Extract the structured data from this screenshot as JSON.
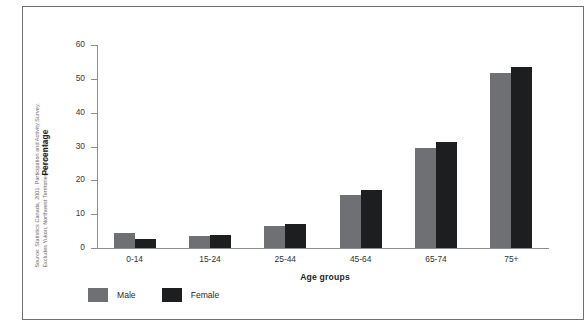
{
  "source_note": {
    "line1": "Source: Statistics Canada, 2001. Participation and Activity Survey.",
    "line2": "Excludes Yukon, Northwest Territories and Nunavut."
  },
  "legend": {
    "male_label": "Male",
    "female_label": "Female",
    "male_color": "#6e7073",
    "female_color": "#1d1e20"
  },
  "chart_data": {
    "type": "bar",
    "title": "",
    "xlabel": "Age groups",
    "ylabel": "Percentage",
    "categories": [
      "0-14",
      "15-24",
      "25-44",
      "45-64",
      "65-74",
      "75+"
    ],
    "series": [
      {
        "name": "Male",
        "values": [
          4.3,
          3.6,
          6.4,
          15.6,
          29.6,
          51.6
        ],
        "color": "#6e7073"
      },
      {
        "name": "Female",
        "values": [
          2.6,
          3.9,
          7.0,
          17.0,
          31.3,
          53.6
        ],
        "color": "#1d1e20"
      }
    ],
    "ylim": [
      0,
      60
    ],
    "yticks": [
      0,
      10,
      20,
      30,
      40,
      50,
      60
    ],
    "ytick_labels": [
      "0",
      "10",
      "20",
      "30",
      "40",
      "50",
      "60"
    ],
    "grid": false,
    "legend_position": "bottom-left"
  }
}
